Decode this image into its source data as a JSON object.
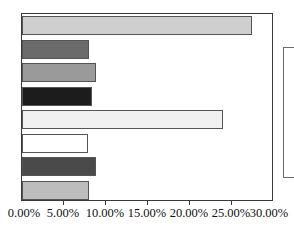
{
  "chart_data": {
    "type": "bar",
    "orientation": "horizontal",
    "title": "",
    "subtitle": "",
    "xlabel": "",
    "ylabel": "",
    "xlim": [
      0,
      0.3
    ],
    "ylim": null,
    "grid": false,
    "legend_position": "right",
    "legend_visible_labels": [],
    "categories": [
      "",
      "",
      "",
      "",
      "",
      "",
      "",
      ""
    ],
    "values": [
      0.274,
      0.08,
      0.088,
      0.083,
      0.239,
      0.079,
      0.088,
      0.08
    ],
    "value_labels": [
      "27.40%",
      "8.00%",
      "8.80%",
      "8.30%",
      "23.90%",
      "7.90%",
      "8.80%",
      "8.00%"
    ],
    "bar_colors": [
      "#cfcfcf",
      "#6b6b6b",
      "#9a9a9a",
      "#1c1c1c",
      "#f1f1f1",
      "#ffffff",
      "#4a4a4a",
      "#bdbdbd"
    ],
    "bar_edge_color": "#555555",
    "axis_color": "#3a3a3a",
    "background_color": "#ffffff",
    "text_color": "#111111",
    "xticks": [
      0.0,
      0.05,
      0.1,
      0.15,
      0.2,
      0.25,
      0.3
    ],
    "xtick_labels": [
      "0.00%",
      "5.00%",
      "10.00%",
      "15.00%",
      "20.00%",
      "25.00%",
      "30.00%"
    ],
    "series": [
      {
        "name": "series-1",
        "values": [
          0.274,
          0.08,
          0.088,
          0.083,
          0.239,
          0.079,
          0.088,
          0.08
        ]
      }
    ]
  },
  "axis": {
    "x_tick_labels": [
      "0.00%",
      "5.00%",
      "10.00%",
      "15.00%",
      "20.00%",
      "25.00%",
      "30.00%"
    ]
  },
  "legend": {
    "visible": true,
    "clipped": true,
    "entries": []
  }
}
